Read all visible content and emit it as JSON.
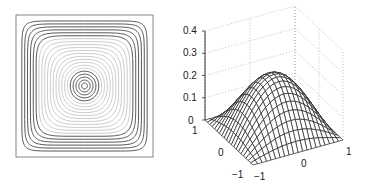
{
  "chart_data": [
    {
      "type": "contour",
      "title": "",
      "xlabel": "",
      "ylabel": "",
      "domain": {
        "x": [
          -1,
          1
        ],
        "y": [
          -1,
          1
        ]
      },
      "function": "z = 0.25*cos(pi*x/2)*cos(pi*y/2) (approx.)",
      "levels": 22,
      "grid": false
    },
    {
      "type": "surface",
      "title": "",
      "xlabel": "",
      "ylabel": "",
      "zlabel": "",
      "x_ticks": [
        "-1",
        "0",
        "1"
      ],
      "y_ticks": [
        "-1",
        "0",
        "1"
      ],
      "z_ticks": [
        "0",
        "0.1",
        "0.2",
        "0.3",
        "0.4"
      ],
      "xlim": [
        -1,
        1
      ],
      "ylim": [
        -1,
        1
      ],
      "zlim": [
        0,
        0.4
      ],
      "peak_value": 0.25,
      "grid": true,
      "mesh_lines": 21
    }
  ],
  "labels": {
    "z": [
      "0",
      "0.1",
      "0.2",
      "0.3",
      "0.4"
    ],
    "y_left": [
      "1",
      "0",
      "−1"
    ],
    "x_front": [
      "−1",
      "0",
      "1"
    ]
  }
}
